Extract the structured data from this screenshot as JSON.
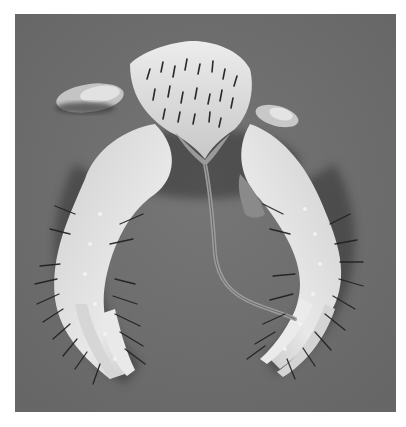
{
  "image": {
    "subject": "spiny crustacean",
    "description": "Grayscale photograph of a hairy, spiny crab-like crustacean with long bristled claws curving downward and a thin tail-like appendage, on a plain gray background",
    "colors": {
      "border": "#ffffff",
      "background": "#6d6d6d",
      "body_light": "#e6e6e6",
      "body_mid": "#bdbdbd",
      "shadow": "#2a2a2a",
      "bristle": "#1e1e1e"
    }
  }
}
